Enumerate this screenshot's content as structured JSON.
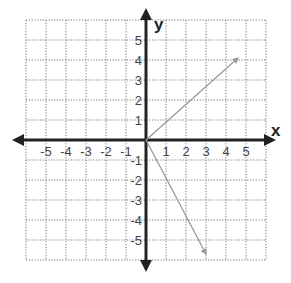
{
  "chart_data": {
    "type": "vector-plot",
    "title": "",
    "xlabel": "x",
    "ylabel": "y",
    "xlim": [
      -6,
      6
    ],
    "ylim": [
      -6,
      6
    ],
    "grid": true,
    "grid_style": "dotted",
    "x_ticks": [
      "-5",
      "-4",
      "-3",
      "-2",
      "-1",
      "1",
      "2",
      "3",
      "4",
      "5"
    ],
    "y_ticks": [
      "5",
      "4",
      "3",
      "2",
      "1",
      "-1",
      "-2",
      "-3",
      "-4",
      "-5"
    ],
    "vectors": [
      {
        "name": "vector-1",
        "from": [
          0,
          0
        ],
        "to": [
          4.6,
          4.1
        ],
        "color": "#9a9a9a"
      },
      {
        "name": "vector-2",
        "from": [
          0,
          0
        ],
        "to": [
          3.0,
          -5.7
        ],
        "color": "#9a9a9a"
      }
    ],
    "axis_color": "#222222",
    "grid_color": "#777777"
  }
}
